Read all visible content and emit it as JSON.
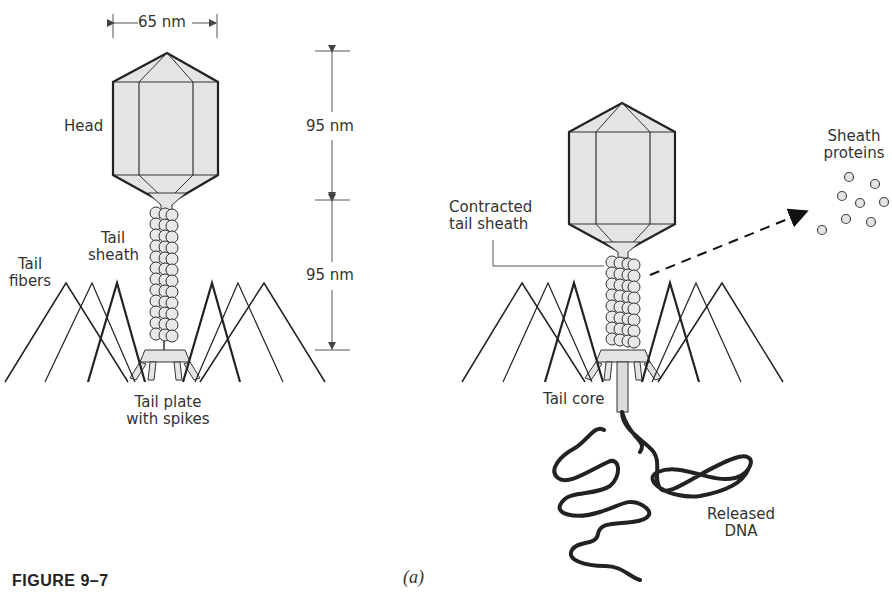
{
  "figure": {
    "caption": "FIGURE 9–7",
    "panel_label": "(a)"
  },
  "left_phage": {
    "labels": {
      "width_dimension": "65 nm",
      "head": "Head",
      "head_height": "95 nm",
      "tail_height": "95 nm",
      "tail_sheath_line1": "Tail",
      "tail_sheath_line2": "sheath",
      "tail_fibers_line1": "Tail",
      "tail_fibers_line2": "fibers",
      "tail_plate_line1": "Tail plate",
      "tail_plate_line2": "with spikes"
    }
  },
  "right_phage": {
    "labels": {
      "contracted_line1": "Contracted",
      "contracted_line2": "tail sheath",
      "sheath_proteins_line1": "Sheath",
      "sheath_proteins_line2": "proteins",
      "tail_core": "Tail core",
      "released_dna_line1": "Released",
      "released_dna_line2": "DNA"
    }
  },
  "colors": {
    "fill": "#e4e4e4",
    "stroke": "#222222",
    "text": "#333333"
  }
}
